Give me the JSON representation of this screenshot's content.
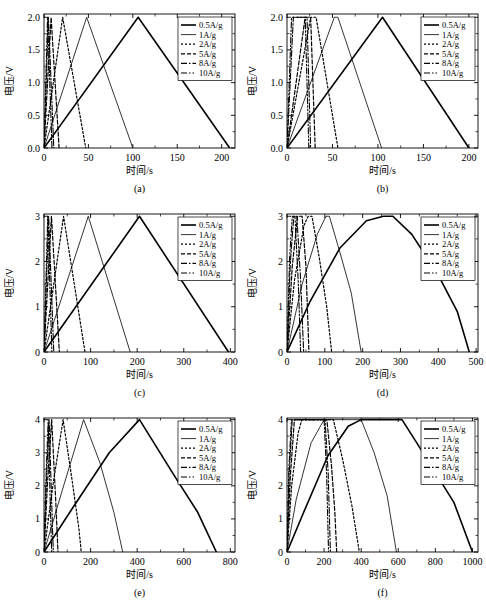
{
  "figure": {
    "axis_labels": {
      "x": "时间/s",
      "y": "电压/V"
    },
    "legend_entries": [
      {
        "label": "0.5A/g",
        "style": "solid-thick"
      },
      {
        "label": "1A/g",
        "style": "solid-thin"
      },
      {
        "label": "2A/g",
        "style": "dotted"
      },
      {
        "label": "5A/g",
        "style": "dashed"
      },
      {
        "label": "8A/g",
        "style": "dash-dot"
      },
      {
        "label": "10A/g",
        "style": "dash-dot-dot"
      }
    ]
  },
  "chart_data": [
    {
      "type": "line",
      "panel": "(a)",
      "title": "",
      "xlabel": "时间/s",
      "ylabel": "电压/V",
      "xlim": [
        0,
        215
      ],
      "ylim": [
        0,
        2.05
      ],
      "xticks": [
        0,
        50,
        100,
        150,
        200
      ],
      "yticks": [
        "0.0",
        "0.5",
        "1.0",
        "1.5",
        "2.0"
      ],
      "ytick_values": [
        0,
        0.5,
        1.0,
        1.5,
        2.0
      ],
      "grid": false,
      "legend_position": "top-right",
      "shape": "triangular",
      "series": [
        {
          "name": "0.5A/g",
          "points": [
            [
              0,
              0
            ],
            [
              106,
              2.0
            ],
            [
              209,
              0
            ]
          ]
        },
        {
          "name": "1A/g",
          "points": [
            [
              0,
              0
            ],
            [
              48,
              2.0
            ],
            [
              100,
              0
            ]
          ]
        },
        {
          "name": "2A/g",
          "points": [
            [
              0,
              0
            ],
            [
              21,
              2.0
            ],
            [
              47,
              0
            ]
          ]
        },
        {
          "name": "5A/g",
          "points": [
            [
              0,
              0
            ],
            [
              8,
              2.0
            ],
            [
              17,
              0
            ]
          ]
        },
        {
          "name": "8A/g",
          "points": [
            [
              0,
              0
            ],
            [
              5,
              2.0
            ],
            [
              11,
              0
            ]
          ]
        },
        {
          "name": "10A/g",
          "points": [
            [
              0,
              0
            ],
            [
              4,
              2.0
            ],
            [
              9,
              0
            ]
          ]
        }
      ]
    },
    {
      "type": "line",
      "panel": "(b)",
      "title": "",
      "xlabel": "时间/s",
      "ylabel": "电压/V",
      "xlim": [
        0,
        210
      ],
      "ylim": [
        0,
        2.05
      ],
      "xticks": [
        0,
        50,
        100,
        150,
        200
      ],
      "yticks": [
        "0.0",
        "0.5",
        "1.0",
        "1.5",
        "2.0"
      ],
      "ytick_values": [
        0,
        0.5,
        1.0,
        1.5,
        2.0
      ],
      "grid": false,
      "legend_position": "top-right",
      "shape": "trapezoidal",
      "series": [
        {
          "name": "0.5A/g",
          "points": [
            [
              0,
              0
            ],
            [
              105,
              2.0
            ],
            [
              200,
              0
            ]
          ]
        },
        {
          "name": "1A/g",
          "points": [
            [
              0,
              0
            ],
            [
              52,
              2.0
            ],
            [
              56,
              2.0
            ],
            [
              104,
              0
            ]
          ]
        },
        {
          "name": "2A/g",
          "points": [
            [
              0,
              0
            ],
            [
              26,
              2.0
            ],
            [
              32,
              2.0
            ],
            [
              56,
              0
            ]
          ]
        },
        {
          "name": "5A/g",
          "points": [
            [
              0,
              0
            ],
            [
              20,
              2.0
            ],
            [
              26,
              2.0
            ],
            [
              31,
              0
            ]
          ]
        },
        {
          "name": "8A/g",
          "points": [
            [
              0,
              0
            ],
            [
              7,
              2.0
            ],
            [
              22,
              2.0
            ],
            [
              26,
              0
            ]
          ]
        },
        {
          "name": "10A/g",
          "points": [
            [
              0,
              0
            ],
            [
              5,
              2.0
            ],
            [
              20,
              2.0
            ],
            [
              24,
              0
            ]
          ]
        }
      ]
    },
    {
      "type": "line",
      "panel": "(c)",
      "title": "",
      "xlabel": "时间/s",
      "ylabel": "电压/V",
      "xlim": [
        0,
        410
      ],
      "ylim": [
        0,
        3.05
      ],
      "xticks": [
        0,
        100,
        200,
        300,
        400
      ],
      "yticks": [
        "0",
        "1",
        "2",
        "3"
      ],
      "ytick_values": [
        0,
        1,
        2,
        3
      ],
      "grid": false,
      "legend_position": "top-right",
      "shape": "triangular",
      "series": [
        {
          "name": "0.5A/g",
          "points": [
            [
              0,
              0
            ],
            [
              205,
              3.0
            ],
            [
              396,
              0
            ]
          ]
        },
        {
          "name": "1A/g",
          "points": [
            [
              0,
              0
            ],
            [
              95,
              3.0
            ],
            [
              185,
              0
            ]
          ]
        },
        {
          "name": "2A/g",
          "points": [
            [
              0,
              0
            ],
            [
              42,
              3.0
            ],
            [
              88,
              0
            ]
          ]
        },
        {
          "name": "5A/g",
          "points": [
            [
              0,
              0
            ],
            [
              16,
              3.0
            ],
            [
              33,
              0
            ]
          ]
        },
        {
          "name": "8A/g",
          "points": [
            [
              0,
              0
            ],
            [
              10,
              3.0
            ],
            [
              21,
              0
            ]
          ]
        },
        {
          "name": "10A/g",
          "points": [
            [
              0,
              0
            ],
            [
              8,
              3.0
            ],
            [
              17,
              0
            ]
          ]
        }
      ]
    },
    {
      "type": "line",
      "panel": "(d)",
      "title": "",
      "xlabel": "时间/s",
      "ylabel": "电压/V",
      "xlim": [
        0,
        505
      ],
      "ylim": [
        0,
        3.05
      ],
      "xticks": [
        0,
        100,
        200,
        300,
        400,
        500
      ],
      "yticks": [
        "0",
        "1",
        "2",
        "3"
      ],
      "ytick_values": [
        0,
        1,
        2,
        3
      ],
      "grid": false,
      "legend_position": "top-right",
      "shape": "rounded-plateau",
      "series": [
        {
          "name": "0.5A/g",
          "points": [
            [
              0,
              0
            ],
            [
              60,
              1.1
            ],
            [
              140,
              2.3
            ],
            [
              210,
              2.9
            ],
            [
              255,
              3.0
            ],
            [
              280,
              3.0
            ],
            [
              330,
              2.6
            ],
            [
              400,
              1.7
            ],
            [
              450,
              0.9
            ],
            [
              482,
              0
            ]
          ]
        },
        {
          "name": "1A/g",
          "points": [
            [
              0,
              0
            ],
            [
              40,
              1.5
            ],
            [
              80,
              2.6
            ],
            [
              103,
              3.0
            ],
            [
              112,
              3.0
            ],
            [
              140,
              2.2
            ],
            [
              170,
              1.3
            ],
            [
              196,
              0
            ]
          ]
        },
        {
          "name": "2A/g",
          "points": [
            [
              0,
              0
            ],
            [
              20,
              1.6
            ],
            [
              45,
              2.8
            ],
            [
              56,
              3.0
            ],
            [
              66,
              3.0
            ],
            [
              85,
              2.1
            ],
            [
              105,
              1.0
            ],
            [
              118,
              0
            ]
          ]
        },
        {
          "name": "5A/g",
          "points": [
            [
              0,
              0
            ],
            [
              14,
              1.9
            ],
            [
              28,
              3.0
            ],
            [
              40,
              3.0
            ],
            [
              50,
              1.9
            ],
            [
              58,
              0
            ]
          ]
        },
        {
          "name": "8A/g",
          "points": [
            [
              0,
              0
            ],
            [
              9,
              2.0
            ],
            [
              18,
              3.0
            ],
            [
              26,
              3.0
            ],
            [
              36,
              1.6
            ],
            [
              44,
              0
            ]
          ]
        },
        {
          "name": "10A/g",
          "points": [
            [
              0,
              0
            ],
            [
              7,
              2.1
            ],
            [
              14,
              3.0
            ],
            [
              21,
              3.0
            ],
            [
              30,
              1.5
            ],
            [
              36,
              0
            ]
          ]
        }
      ]
    },
    {
      "type": "line",
      "panel": "(e)",
      "title": "",
      "xlabel": "时间/s",
      "ylabel": "电压/V",
      "xlim": [
        0,
        820
      ],
      "ylim": [
        0,
        4.05
      ],
      "xticks": [
        0,
        200,
        400,
        600,
        800
      ],
      "yticks": [
        "0",
        "1",
        "2",
        "3",
        "4"
      ],
      "ytick_values": [
        0,
        1,
        2,
        3,
        4
      ],
      "grid": false,
      "legend_position": "top-right",
      "shape": "triangular",
      "series": [
        {
          "name": "0.5A/g",
          "points": [
            [
              0,
              0
            ],
            [
              120,
              1.3
            ],
            [
              280,
              3.0
            ],
            [
              410,
              4.0
            ],
            [
              560,
              2.3
            ],
            [
              660,
              1.2
            ],
            [
              740,
              0
            ]
          ]
        },
        {
          "name": "1A/g",
          "points": [
            [
              0,
              0
            ],
            [
              80,
              1.9
            ],
            [
              170,
              4.0
            ],
            [
              240,
              2.7
            ],
            [
              300,
              1.2
            ],
            [
              338,
              0
            ]
          ]
        },
        {
          "name": "2A/g",
          "points": [
            [
              0,
              0
            ],
            [
              40,
              2.1
            ],
            [
              82,
              4.0
            ],
            [
              120,
              2.2
            ],
            [
              150,
              0.7
            ],
            [
              160,
              0
            ]
          ]
        },
        {
          "name": "5A/g",
          "points": [
            [
              0,
              0
            ],
            [
              16,
              2.2
            ],
            [
              33,
              4.0
            ],
            [
              50,
              1.6
            ],
            [
              60,
              0
            ]
          ]
        },
        {
          "name": "8A/g",
          "points": [
            [
              0,
              0
            ],
            [
              11,
              2.3
            ],
            [
              22,
              4.0
            ],
            [
              33,
              1.5
            ],
            [
              40,
              0
            ]
          ]
        },
        {
          "name": "10A/g",
          "points": [
            [
              0,
              0
            ],
            [
              9,
              2.3
            ],
            [
              18,
              4.0
            ],
            [
              27,
              1.4
            ],
            [
              33,
              0
            ]
          ]
        }
      ]
    },
    {
      "type": "line",
      "panel": "(f)",
      "title": "",
      "xlabel": "时间/s",
      "ylabel": "电压/V",
      "xlim": [
        0,
        1030
      ],
      "ylim": [
        0,
        4.05
      ],
      "xticks": [
        0,
        200,
        400,
        600,
        800,
        1000
      ],
      "yticks": [
        "0",
        "1",
        "2",
        "3",
        "4"
      ],
      "ytick_values": [
        0,
        1,
        2,
        3,
        4
      ],
      "grid": false,
      "legend_position": "top-right",
      "shape": "flat-plateau",
      "series": [
        {
          "name": "0.5A/g",
          "points": [
            [
              0,
              0
            ],
            [
              90,
              1.2
            ],
            [
              220,
              2.9
            ],
            [
              330,
              3.8
            ],
            [
              400,
              4.0
            ],
            [
              620,
              4.0
            ],
            [
              700,
              3.3
            ],
            [
              800,
              2.4
            ],
            [
              900,
              1.5
            ],
            [
              1000,
              0
            ]
          ]
        },
        {
          "name": "1A/g",
          "points": [
            [
              0,
              0
            ],
            [
              50,
              1.6
            ],
            [
              130,
              3.3
            ],
            [
              200,
              4.0
            ],
            [
              400,
              4.0
            ],
            [
              470,
              3.0
            ],
            [
              540,
              1.7
            ],
            [
              590,
              0
            ]
          ]
        },
        {
          "name": "2A/g",
          "points": [
            [
              0,
              0
            ],
            [
              25,
              2.0
            ],
            [
              60,
              3.6
            ],
            [
              80,
              4.0
            ],
            [
              250,
              4.0
            ],
            [
              300,
              2.8
            ],
            [
              350,
              1.4
            ],
            [
              390,
              0
            ]
          ]
        },
        {
          "name": "5A/g",
          "points": [
            [
              0,
              0
            ],
            [
              18,
              2.3
            ],
            [
              40,
              4.0
            ],
            [
              215,
              4.0
            ],
            [
              240,
              2.6
            ],
            [
              258,
              1.2
            ],
            [
              268,
              0
            ]
          ]
        },
        {
          "name": "8A/g",
          "points": [
            [
              0,
              0
            ],
            [
              12,
              2.4
            ],
            [
              28,
              4.0
            ],
            [
              205,
              4.0
            ],
            [
              222,
              2.4
            ],
            [
              234,
              0
            ]
          ]
        },
        {
          "name": "10A/g",
          "points": [
            [
              0,
              0
            ],
            [
              10,
              2.5
            ],
            [
              24,
              4.0
            ],
            [
              200,
              4.0
            ],
            [
              214,
              2.3
            ],
            [
              224,
              0
            ]
          ]
        }
      ]
    }
  ]
}
